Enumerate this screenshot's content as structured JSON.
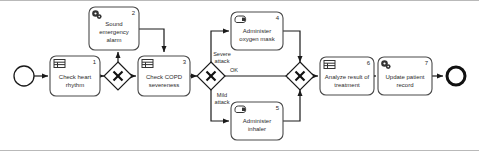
{
  "diagram": {
    "notation": "BPMN",
    "colors": {
      "stroke": "#1a1a1a",
      "task_stroke": "#4a4a4a",
      "fill": "#ffffff",
      "text": "#2b2b2b",
      "frame": "#b9b9b9"
    },
    "events": {
      "start": {
        "name": "start-event",
        "label": ""
      },
      "end": {
        "name": "end-event",
        "label": ""
      }
    },
    "tasks": [
      {
        "number": "1",
        "line1": "Check heart",
        "line2": "rhythm",
        "icon": "user-task-icon",
        "x": 50,
        "y": 55,
        "w": 50,
        "h": 40
      },
      {
        "number": "2",
        "line1": "Sound",
        "line2": "emergency",
        "line3": "alarm",
        "icon": "service-task-gear-icon",
        "x": 89,
        "y": 6,
        "w": 50,
        "h": 43
      },
      {
        "number": "3",
        "line1": "Check COPD",
        "line2": "severeness",
        "icon": "user-task-icon",
        "x": 138,
        "y": 55,
        "w": 52,
        "h": 40
      },
      {
        "number": "4",
        "line1": "Administer",
        "line2": "oxygen mask",
        "icon": "manual-task-hand-icon",
        "x": 231,
        "y": 11,
        "w": 52,
        "h": 38
      },
      {
        "number": "5",
        "line1": "Administer",
        "line2": "inhaler",
        "icon": "manual-task-hand-icon",
        "x": 231,
        "y": 101,
        "w": 52,
        "h": 38
      },
      {
        "number": "6",
        "line1": "Analyze result of",
        "line2": "treatment",
        "icon": "user-task-icon",
        "x": 320,
        "y": 56,
        "w": 54,
        "h": 38
      },
      {
        "number": "7",
        "line1": "Update patient",
        "line2": "record",
        "icon": "service-task-gear-icon",
        "x": 378,
        "y": 56,
        "w": 54,
        "h": 38
      }
    ],
    "gateways": [
      {
        "name": "gateway-heart-rhythm-split",
        "type": "exclusive",
        "cx": 118,
        "cy": 75
      },
      {
        "name": "gateway-severity-split",
        "type": "exclusive",
        "cx": 211,
        "cy": 75
      },
      {
        "name": "gateway-treatment-merge",
        "type": "exclusive",
        "cx": 300,
        "cy": 75
      }
    ],
    "flow_labels": [
      {
        "name": "flow-label-severe-attack",
        "line1": "Severe",
        "line2": "attack"
      },
      {
        "name": "flow-label-ok",
        "line1": "OK",
        "line2": ""
      },
      {
        "name": "flow-label-mild-attack",
        "line1": "Mild",
        "line2": "attack"
      }
    ]
  }
}
